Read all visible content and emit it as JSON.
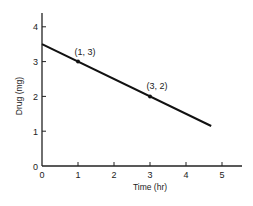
{
  "chart_data": {
    "type": "line",
    "title": "",
    "xlabel": "Time (hr)",
    "ylabel": "Drug (mg)",
    "xlim": [
      0,
      5.5
    ],
    "ylim": [
      0,
      4.4
    ],
    "x_ticks": [
      0,
      1,
      2,
      3,
      4,
      5
    ],
    "y_ticks": [
      0,
      1,
      2,
      3,
      4
    ],
    "x_tick_labels": [
      "0",
      "1",
      "2",
      "3",
      "4",
      "5"
    ],
    "y_tick_labels": [
      "0",
      "1",
      "2",
      "3",
      "4"
    ],
    "grid": false,
    "legend": null,
    "series": [
      {
        "name": "Drug amount",
        "x": [
          0,
          4.7
        ],
        "y": [
          3.5,
          1.15
        ]
      }
    ],
    "points": [
      {
        "x": 1,
        "y": 3,
        "label": "(1, 3)"
      },
      {
        "x": 3,
        "y": 2,
        "label": "(3, 2)"
      }
    ],
    "colors": {
      "line": "#111111",
      "axis": "#222222"
    }
  }
}
